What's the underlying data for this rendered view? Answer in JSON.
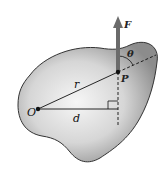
{
  "diagram": {
    "type": "torque-lever-arm",
    "labels": {
      "force": "F",
      "point": "P",
      "origin": "O",
      "radius": "r",
      "lever_arm": "d",
      "angle": "θ"
    },
    "colors": {
      "body_fill_light": "#f4f4f4",
      "body_fill_dark": "#8a8a8a",
      "outline": "#333333",
      "arrow": "#6b6b6b",
      "line": "#111111"
    }
  }
}
